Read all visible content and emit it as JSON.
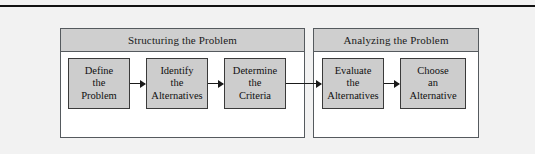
{
  "figure": {
    "name": "decision-making-process-flow",
    "top_rule": true,
    "background_color": "#f2f2f2",
    "panels": [
      {
        "id": "structuring",
        "title": "Structuring the Problem",
        "steps": [
          {
            "id": "define",
            "lines": [
              "Define",
              "the",
              "Problem"
            ]
          },
          {
            "id": "identify",
            "lines": [
              "Identify",
              "the",
              "Alternatives"
            ]
          },
          {
            "id": "determine",
            "lines": [
              "Determine",
              "the",
              "Criteria"
            ]
          }
        ]
      },
      {
        "id": "analyzing",
        "title": "Analyzing the Problem",
        "steps": [
          {
            "id": "evaluate",
            "lines": [
              "Evaluate",
              "the",
              "Alternatives"
            ]
          },
          {
            "id": "choose",
            "lines": [
              "Choose",
              "an",
              "Alternative"
            ]
          }
        ]
      }
    ],
    "connectors": [
      {
        "id": "define-to-identify",
        "from": "define",
        "to": "identify",
        "style": "arrow-right"
      },
      {
        "id": "identify-to-determine",
        "from": "identify",
        "to": "determine",
        "style": "arrow-right"
      },
      {
        "id": "determine-to-evaluate",
        "from": "determine",
        "to": "evaluate",
        "style": "arrow-right"
      },
      {
        "id": "evaluate-to-choose",
        "from": "evaluate",
        "to": "choose",
        "style": "arrow-right"
      }
    ],
    "colors": {
      "box_fill": "#cdcdcd",
      "box_border": "#3a3a3a",
      "header_fill": "#cfcfcf",
      "panel_border": "#555a5e",
      "panel_body": "#ffffff",
      "rule": "#121212",
      "text": "#101010"
    }
  }
}
